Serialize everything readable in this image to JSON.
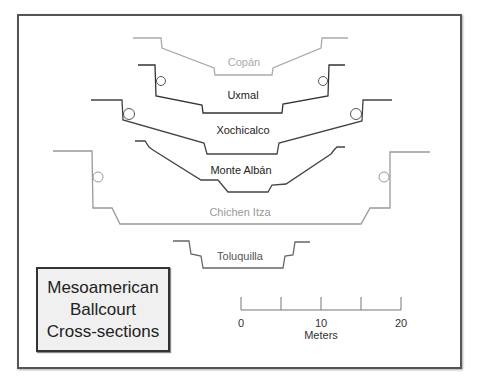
{
  "title": {
    "lines": [
      "Mesoamerican",
      "Ballcourt",
      "Cross-sections"
    ]
  },
  "courts": [
    {
      "name": "Copán",
      "color": "#aaaaaa"
    },
    {
      "name": "Uxmal",
      "color": "#333333"
    },
    {
      "name": "Xochicalco",
      "color": "#444444"
    },
    {
      "name": "Monte Albán",
      "color": "#444444"
    },
    {
      "name": "Chichen Itza",
      "color": "#999999"
    },
    {
      "name": "Toluquilla",
      "color": "#666666"
    }
  ],
  "scale_bar": {
    "labels": [
      "0",
      "10",
      "20"
    ],
    "unit": "Meters"
  },
  "colors": {
    "frame": "#555555",
    "title_box_bg": "#f0f0f0"
  }
}
